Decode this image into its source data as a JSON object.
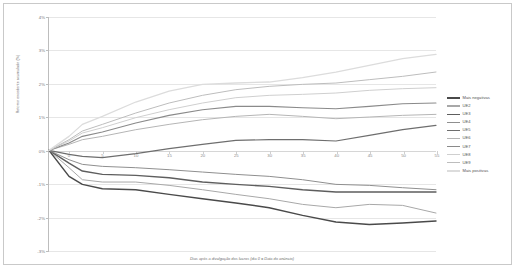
{
  "chart_data": {
    "type": "line",
    "title": "",
    "xlabel": "Dias após a divulgação dos lucros (dia 0 = Data do anúncio)",
    "ylabel": "Retorno excedente acumulado (%)",
    "xlim": [
      -3,
      55
    ],
    "ylim": [
      -3,
      4
    ],
    "ytick_labels": [
      "4%",
      "3%",
      "2%",
      "1%",
      "0%",
      "-1%",
      "-2%",
      "-3%"
    ],
    "ytick_values": [
      4,
      3,
      2,
      1,
      0,
      -1,
      -2,
      -3
    ],
    "xtick_labels": [
      "0",
      "5",
      "10",
      "15",
      "20",
      "25",
      "30",
      "35",
      "40",
      "45",
      "50",
      "55"
    ],
    "xtick_values": [
      0,
      5,
      10,
      15,
      20,
      25,
      30,
      35,
      40,
      45,
      50,
      55
    ],
    "grid": true,
    "legend_position": "right",
    "x": [
      -3,
      0,
      2,
      5,
      10,
      15,
      20,
      25,
      30,
      35,
      40,
      45,
      50,
      55
    ],
    "series": [
      {
        "name": "Mais negativas",
        "color": "#4a4a4a",
        "width": 1.5,
        "values": [
          0,
          -0.78,
          -1.02,
          -1.15,
          -1.18,
          -1.32,
          -1.45,
          -1.58,
          -1.72,
          -1.95,
          -2.15,
          -2.22,
          -2.18,
          -2.12
        ]
      },
      {
        "name": "UE2",
        "color": "#a8a8a8",
        "width": 1.0,
        "values": [
          0,
          -0.52,
          -0.88,
          -0.95,
          -0.95,
          -1.05,
          -1.18,
          -1.32,
          -1.45,
          -1.62,
          -1.72,
          -1.62,
          -1.65,
          -1.88
        ]
      },
      {
        "name": "UE3",
        "color": "#5e5e5e",
        "width": 1.4,
        "values": [
          0,
          -0.38,
          -0.62,
          -0.72,
          -0.75,
          -0.82,
          -0.95,
          -1.02,
          -1.08,
          -1.18,
          -1.25,
          -1.25,
          -1.25,
          -1.25
        ]
      },
      {
        "name": "UE4",
        "color": "#8f8f8f",
        "width": 1.0,
        "values": [
          0,
          -0.28,
          -0.42,
          -0.48,
          -0.52,
          -0.58,
          -0.65,
          -0.72,
          -0.78,
          -0.88,
          -1.02,
          -1.05,
          -1.12,
          -1.18
        ]
      },
      {
        "name": "UE5",
        "color": "#6e6e6e",
        "width": 1.2,
        "values": [
          0,
          -0.12,
          -0.18,
          -0.22,
          -0.1,
          0.05,
          0.18,
          0.3,
          0.32,
          0.32,
          0.28,
          0.45,
          0.62,
          0.75
        ]
      },
      {
        "name": "UE6",
        "color": "#b5b5b5",
        "width": 1.0,
        "values": [
          0,
          0.18,
          0.32,
          0.42,
          0.62,
          0.78,
          0.92,
          1.02,
          1.08,
          1.02,
          0.95,
          1.0,
          1.05,
          1.08
        ]
      },
      {
        "name": "UE7",
        "color": "#8a8a8a",
        "width": 1.1,
        "values": [
          0,
          0.22,
          0.42,
          0.55,
          0.82,
          1.05,
          1.22,
          1.32,
          1.32,
          1.28,
          1.25,
          1.32,
          1.4,
          1.42
        ]
      },
      {
        "name": "UE8",
        "color": "#cfcfcf",
        "width": 1.0,
        "values": [
          0,
          0.28,
          0.52,
          0.68,
          0.98,
          1.22,
          1.42,
          1.58,
          1.65,
          1.68,
          1.72,
          1.8,
          1.85,
          1.88
        ]
      },
      {
        "name": "UE9",
        "color": "#bdbdbd",
        "width": 1.0,
        "values": [
          0,
          0.32,
          0.58,
          0.78,
          1.12,
          1.42,
          1.65,
          1.82,
          1.92,
          1.98,
          2.02,
          2.12,
          2.22,
          2.35
        ]
      },
      {
        "name": "Mais positivas",
        "color": "#dcdcdc",
        "width": 1.3,
        "values": [
          0,
          0.42,
          0.78,
          1.02,
          1.45,
          1.78,
          1.98,
          2.02,
          2.05,
          2.18,
          2.35,
          2.55,
          2.75,
          2.88
        ]
      }
    ]
  },
  "legend": {
    "items": [
      {
        "label": "Mais negativas"
      },
      {
        "label": "UE2"
      },
      {
        "label": "UE3"
      },
      {
        "label": "UE4"
      },
      {
        "label": "UE5"
      },
      {
        "label": "UE6"
      },
      {
        "label": "UE7"
      },
      {
        "label": "UE8"
      },
      {
        "label": "UE9"
      },
      {
        "label": "Mais positivas"
      }
    ]
  }
}
